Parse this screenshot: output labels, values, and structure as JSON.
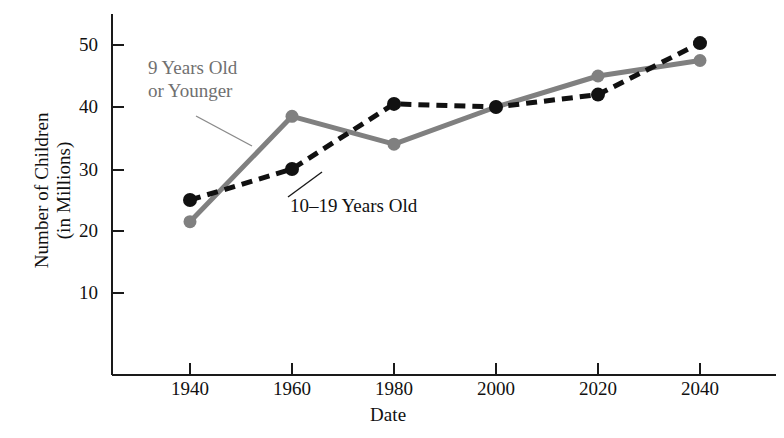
{
  "chart_data": {
    "type": "line",
    "title": "",
    "xlabel": "Date",
    "ylabel": "Number of Children (in Millions)",
    "ylabel_line1": "Number of Children",
    "ylabel_line2": "(in Millions)",
    "x": [
      1940,
      1960,
      1980,
      2000,
      2020,
      2040
    ],
    "xticklabels": [
      "1940",
      "1960",
      "1980",
      "2000",
      "2020",
      "2040"
    ],
    "yticks": [
      10,
      20,
      30,
      40,
      50
    ],
    "yticklabels": [
      "10",
      "20",
      "30",
      "40",
      "50"
    ],
    "xlim": [
      1930,
      2055
    ],
    "ylim": [
      0,
      55
    ],
    "grid": false,
    "legend_position": "inline-annotations",
    "series": [
      {
        "name": "9 Years Old or Younger",
        "label_line1": "9 Years Old",
        "label_line2": "or Younger",
        "color": "#808080",
        "linestyle": "solid",
        "marker": "circle",
        "values": [
          21.5,
          38.5,
          34.0,
          40.0,
          45.0,
          47.5
        ]
      },
      {
        "name": "10-19 Years Old",
        "label_line1": "10–19 Years Old",
        "label_line2": "",
        "color": "#111111",
        "linestyle": "dashed",
        "marker": "circle",
        "values": [
          25.0,
          30.0,
          40.5,
          40.0,
          42.0,
          50.3
        ]
      }
    ],
    "annotations": [
      {
        "text_line1": "9 Years Old",
        "text_line2": "or Younger",
        "color": "#707070",
        "points_to_series": "9 Years Old or Younger"
      },
      {
        "text_line1": "10–19 Years Old",
        "text_line2": "",
        "color": "#111111",
        "points_to_series": "10-19 Years Old"
      }
    ]
  },
  "axes": {
    "x_title": "Date",
    "y_title_line1": "Number of Children",
    "y_title_line2": "(in Millions)"
  },
  "ticks": {
    "x": [
      "1940",
      "1960",
      "1980",
      "2000",
      "2020",
      "2040"
    ],
    "y": [
      "50",
      "40",
      "30",
      "20",
      "10"
    ]
  },
  "annotations": {
    "young_line1": "9 Years Old",
    "young_line2": "or Younger",
    "teen_line1": "10–19 Years Old"
  },
  "colors": {
    "series_young": "#808080",
    "series_teen": "#111111",
    "axis": "#1a1a1a",
    "background": "#ffffff"
  }
}
